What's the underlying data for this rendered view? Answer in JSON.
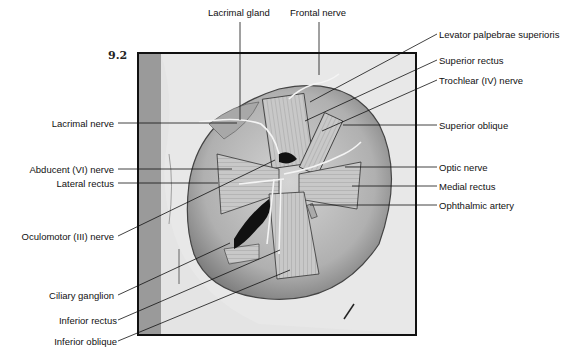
{
  "figure": {
    "number": "9.2",
    "caption": ""
  },
  "labels": {
    "top": [
      {
        "text": "Lacrimal gland"
      },
      {
        "text": "Frontal nerve"
      }
    ],
    "left": [
      {
        "text": "Lacrimal nerve"
      },
      {
        "text": "Abducent (VI) nerve"
      },
      {
        "text": "Lateral rectus"
      },
      {
        "text": "Oculomotor (III) nerve"
      },
      {
        "text": "Ciliary ganglion"
      },
      {
        "text": "Inferior rectus"
      },
      {
        "text": "Inferior oblique"
      }
    ],
    "right": [
      {
        "text": "Levator palpebrae superioris"
      },
      {
        "text": "Superior rectus"
      },
      {
        "text": "Trochlear (IV) nerve"
      },
      {
        "text": "Superior oblique"
      },
      {
        "text": "Optic nerve"
      },
      {
        "text": "Medial rectus"
      },
      {
        "text": "Ophthalmic artery"
      }
    ]
  },
  "colors": {
    "ink": "#111111",
    "frame_bg": "#e4e4e4",
    "orbit_shadow": "#9a9a9a",
    "muscle": "#bdbdbd"
  }
}
